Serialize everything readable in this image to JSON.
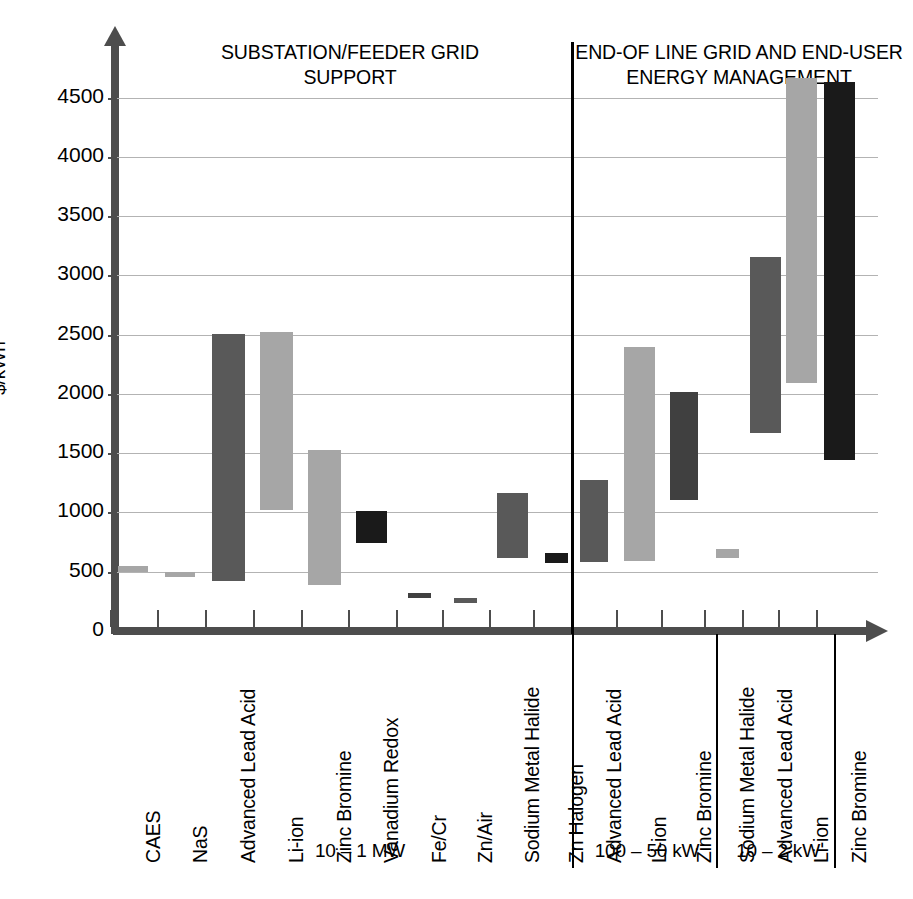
{
  "chart_data": {
    "type": "bar",
    "subtype": "floating-range-bar",
    "title": "",
    "xlabel": "",
    "ylabel": "$/kWh",
    "ylim": [
      0,
      4860
    ],
    "yticks": [
      0,
      500,
      1000,
      1500,
      2000,
      2500,
      3000,
      3500,
      4000,
      4500
    ],
    "ytick_labels": [
      "0",
      "500",
      "1000",
      "1500",
      "2000",
      "2500",
      "3000",
      "3500",
      "4000",
      "4500"
    ],
    "grid": true,
    "legend": "none",
    "section_headers": [
      "SUBSTATION/FEEDER GRID\nSUPPORT",
      "END-OF LINE GRID AND END-USER\nENERGY MANAGEMENT"
    ],
    "groups": [
      {
        "name": "10 – 1 MW",
        "label": "10 – 1 MW",
        "categories": [
          "CAES",
          "NaS",
          "Advanced Lead Acid",
          "Li-ion",
          "Zinc Bromine",
          "Vanadium Redox",
          "Fe/Cr",
          "Zn/Air",
          "Sodium Metal Halide",
          "Zn Halogen"
        ],
        "low": [
          500,
          455,
          420,
          1020,
          390,
          745,
          275,
          240,
          620,
          570
        ],
        "high": [
          550,
          500,
          2510,
          2520,
          1525,
          1010,
          320,
          280,
          1165,
          660
        ],
        "colors": [
          "#a6a6a6",
          "#a6a6a6",
          "#595959",
          "#a6a6a6",
          "#a6a6a6",
          "#1a1a1a",
          "#404040",
          "#595959",
          "#595959",
          "#1a1a1a"
        ]
      },
      {
        "name": "100 – 50 kW",
        "label": "100 – 50 kW",
        "categories": [
          "Advanced Lead Acid",
          "Li-ion",
          "Zinc Bromine",
          "Sodium Metal Halide"
        ],
        "low": [
          580,
          590,
          1105,
          620
        ],
        "high": [
          1270,
          2400,
          2020,
          690
        ],
        "colors": [
          "#595959",
          "#a6a6a6",
          "#404040",
          "#a6a6a6"
        ]
      },
      {
        "name": "10 – 2 kW",
        "label": "10 – 2 kW",
        "categories": [
          "Advanced Lead Acid",
          "Li-ion",
          "Zinc Bromine"
        ],
        "low": [
          1670,
          2090,
          1440
        ],
        "high": [
          3155,
          4670,
          4630
        ],
        "colors": [
          "#595959",
          "#a6a6a6",
          "#1a1a1a"
        ]
      }
    ]
  },
  "colors": {
    "dark_gray": "#595959",
    "light_gray": "#a6a6a6",
    "near_black": "#1a1a1a",
    "mid_gray": "#404040",
    "axis": "#4d4d4d",
    "grid": "#b3b3b3",
    "divider": "#000000"
  }
}
